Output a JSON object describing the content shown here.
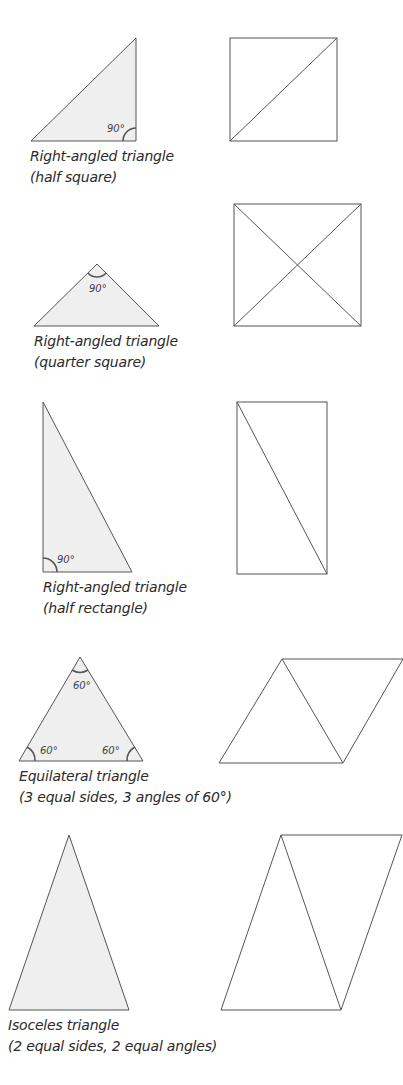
{
  "diagram": {
    "colors": {
      "fill": "#efefef",
      "stroke": "#555555",
      "text": "#2a2a2a"
    },
    "rows": [
      {
        "id": "half-square",
        "caption_line1": "Right-angled triangle",
        "caption_line2": "(half square)",
        "angle_labels": [
          "90°"
        ],
        "companion_shape": "square with one diagonal"
      },
      {
        "id": "quarter-square",
        "caption_line1": "Right-angled triangle",
        "caption_line2": "(quarter square)",
        "angle_labels": [
          "90°"
        ],
        "companion_shape": "square with both diagonals"
      },
      {
        "id": "half-rectangle",
        "caption_line1": "Right-angled triangle",
        "caption_line2": "(half rectangle)",
        "angle_labels": [
          "90°"
        ],
        "companion_shape": "rectangle with one diagonal"
      },
      {
        "id": "equilateral",
        "caption_line1": "Equilateral triangle",
        "caption_line2": "(3 equal sides, 3 angles of 60°)",
        "angle_labels": [
          "60°",
          "60°",
          "60°"
        ],
        "companion_shape": "rhombus split into two equilateral triangles"
      },
      {
        "id": "isoceles",
        "caption_line1": "Isoceles triangle",
        "caption_line2": "(2 equal sides, 2 equal angles)",
        "angle_labels": [],
        "companion_shape": "parallelogram split into two isoceles triangles"
      }
    ]
  }
}
